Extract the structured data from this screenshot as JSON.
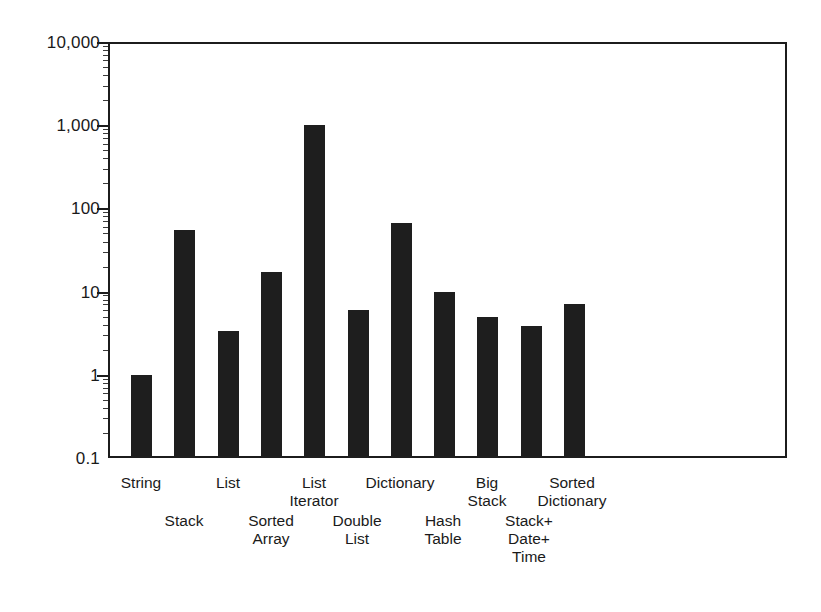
{
  "chart_data": {
    "type": "bar",
    "title": "",
    "subtitle": "",
    "xlabel": "",
    "ylabel": "",
    "scale": "log",
    "ylim": [
      0.1,
      10000
    ],
    "grid": false,
    "legend": null,
    "y_ticks": [
      {
        "label": "10,000",
        "value": 10000
      },
      {
        "label": "1,000",
        "value": 1000
      },
      {
        "label": "100",
        "value": 100
      },
      {
        "label": "10",
        "value": 10
      },
      {
        "label": "1",
        "value": 1
      },
      {
        "label": "0.1",
        "value": 0.1
      }
    ],
    "categories": [
      "String",
      "Stack",
      "List",
      "Sorted Array",
      "List Iterator",
      "Double List",
      "Dictionary",
      "Hash Table",
      "Big Stack",
      "Stack+ Date+ Time",
      "Sorted Dictionary"
    ],
    "values": [
      1.0,
      55,
      3.4,
      17,
      1000,
      6.0,
      66,
      10,
      4.9,
      3.9,
      7.0
    ],
    "bar_color": "#1e1e1e"
  },
  "axis": {
    "tick_10000": "10,000",
    "tick_1000": "1,000",
    "tick_100": "100",
    "tick_10": "10",
    "tick_1": "1",
    "tick_0_1": "0.1"
  },
  "x_labels": {
    "row_top": [
      {
        "line1": "String",
        "line2": ""
      },
      {
        "line1": "List",
        "line2": ""
      },
      {
        "line1": "List",
        "line2": "Iterator"
      },
      {
        "line1": "Dictionary",
        "line2": ""
      },
      {
        "line1": "Big",
        "line2": "Stack"
      },
      {
        "line1": "Sorted",
        "line2": "Dictionary"
      }
    ],
    "row_bottom": [
      {
        "line1": "Stack",
        "line2": "",
        "line3": ""
      },
      {
        "line1": "Sorted",
        "line2": "Array",
        "line3": ""
      },
      {
        "line1": "Double",
        "line2": "List",
        "line3": ""
      },
      {
        "line1": "Hash",
        "line2": "Table",
        "line3": ""
      },
      {
        "line1": "Stack+",
        "line2": "Date+",
        "line3": "Time"
      }
    ]
  }
}
